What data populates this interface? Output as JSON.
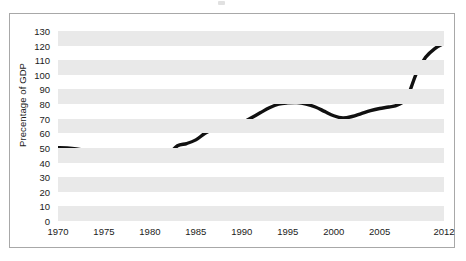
{
  "chart_data": {
    "type": "line",
    "title": "",
    "subtitle": "",
    "xlabel": "",
    "ylabel": "Precentage of GDP",
    "xlim": [
      1970,
      2012
    ],
    "ylim": [
      0,
      130
    ],
    "ytick_labels": [
      "130",
      "120",
      "110",
      "100",
      "90",
      "80",
      "70",
      "60",
      "50",
      "40",
      "30",
      "20",
      "10",
      "0"
    ],
    "ytick_values": [
      130,
      120,
      110,
      100,
      90,
      80,
      70,
      60,
      50,
      40,
      30,
      20,
      10,
      0
    ],
    "xtick_labels": [
      "1970",
      "1975",
      "1980",
      "1985",
      "1990",
      "1995",
      "2000",
      "2005",
      "2012"
    ],
    "xtick_values": [
      1970,
      1975,
      1980,
      1985,
      1990,
      1995,
      2000,
      2005,
      2012
    ],
    "grid": "horizontal-alternating-bands",
    "legend": "none",
    "line_color": "#111111",
    "band_color": "#e9e9e9",
    "series": [
      {
        "name": "Percentage of GDP",
        "x": [
          1970,
          1971,
          1972,
          1973,
          1974,
          1975,
          1976,
          1977,
          1978,
          1979,
          1980,
          1981,
          1982,
          1983,
          1984,
          1985,
          1986,
          1987,
          1988,
          1989,
          1990,
          1991,
          1992,
          1993,
          1994,
          1995,
          1996,
          1997,
          1998,
          1999,
          2000,
          2001,
          2002,
          2003,
          2004,
          2005,
          2006,
          2007,
          2008,
          2009,
          2010,
          2011,
          2012
        ],
        "values": [
          50.2,
          50.0,
          49.3,
          48.0,
          46.2,
          46.0,
          47.3,
          47.6,
          46.5,
          44.8,
          44.5,
          43.2,
          45.5,
          51.5,
          53.0,
          55.5,
          60.0,
          63.0,
          64.5,
          65.5,
          67.0,
          70.5,
          74.0,
          77.5,
          80.0,
          80.8,
          81.0,
          80.0,
          78.0,
          75.0,
          72.0,
          70.5,
          71.5,
          73.5,
          75.5,
          77.0,
          78.0,
          79.5,
          85.0,
          101.0,
          112.0,
          118.0,
          121.5
        ]
      }
    ]
  },
  "figure": {
    "border_color": "#a8a8a8",
    "background": "#ffffff"
  }
}
